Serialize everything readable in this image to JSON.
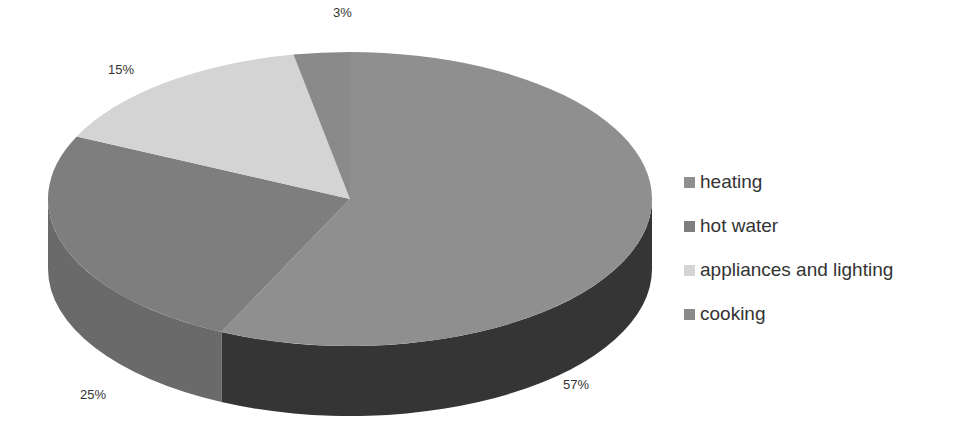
{
  "chart_data": {
    "type": "pie",
    "style": "3d",
    "title": "",
    "categories": [
      "heating",
      "hot water",
      "appliances and lighting",
      "cooking"
    ],
    "values": [
      57,
      25,
      15,
      3
    ],
    "labels": [
      "57%",
      "25%",
      "15%",
      "3%"
    ],
    "colors": [
      "#8f8f8f",
      "#7e7e7e",
      "#d4d4d4",
      "#8a8a8a"
    ],
    "wall_colors": [
      "#353535",
      "#6a6a6a",
      "#b0b0b0",
      "#6e6e6e"
    ],
    "legend_position": "right"
  },
  "legend": {
    "items": [
      {
        "label": "heating",
        "color": "#8f8f8f"
      },
      {
        "label": "hot water",
        "color": "#7e7e7e"
      },
      {
        "label": "appliances and lighting",
        "color": "#d4d4d4"
      },
      {
        "label": "cooking",
        "color": "#8a8a8a"
      }
    ]
  },
  "data_labels": {
    "heating": "57%",
    "hot_water": "25%",
    "appliances": "15%",
    "cooking": "3%"
  }
}
